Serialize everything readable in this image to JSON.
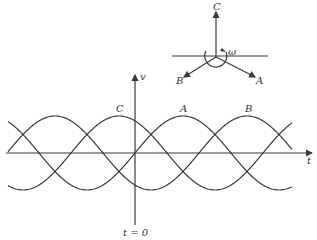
{
  "diagram": {
    "phasor": {
      "labels": {
        "c": "C",
        "b": "B",
        "a": "A",
        "omega": "ω"
      }
    },
    "waveform": {
      "axis_labels": {
        "y": "v",
        "x": "t",
        "origin": "t = 0"
      },
      "curve_labels": {
        "c": "C",
        "a": "A",
        "b": "B"
      }
    },
    "colors": {
      "line": "#3a3a3a",
      "text": "#333333",
      "background": "#ffffff"
    }
  }
}
